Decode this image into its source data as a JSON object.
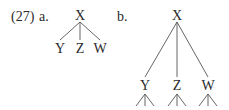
{
  "example": {
    "number": "(27)",
    "a": {
      "label": "a.",
      "root": "X",
      "children": [
        "Y",
        "Z",
        "W"
      ]
    },
    "b": {
      "label": "b.",
      "root": "X",
      "children": [
        "Y",
        "Z",
        "W"
      ],
      "note": "each child has three further branches"
    }
  }
}
